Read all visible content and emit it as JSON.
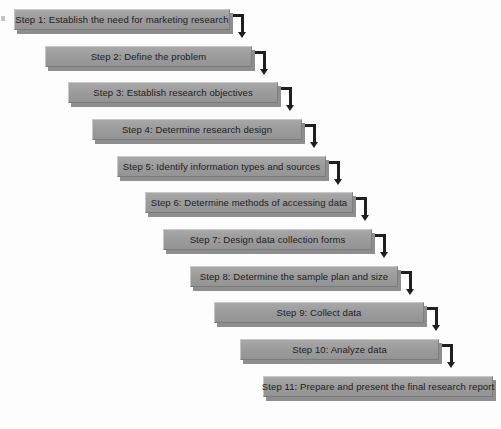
{
  "diagram": {
    "type": "cascading-staircase-flowchart",
    "colors": {
      "box_fill": "#9c9c9c",
      "box_highlight": "#c9c9c9",
      "box_shadow": "#8e8e8e",
      "text": "#1d1d1d",
      "connector": "#1f1f1f",
      "background": "#fdfdfd"
    },
    "layout": {
      "canvas_width": 501,
      "canvas_height": 429,
      "box_height": 21,
      "x_step": 23,
      "y_step": 36.6,
      "shadow_offset_x": 3,
      "shadow_offset_y": 4
    },
    "steps": [
      {
        "number": 1,
        "label": "Step 1: Establish the need for marketing research",
        "x": 14,
        "y": 9,
        "width": 216
      },
      {
        "number": 2,
        "label": "Step 2: Define the problem",
        "x": 45,
        "y": 46,
        "width": 207
      },
      {
        "number": 3,
        "label": "Step 3: Establish research objectives",
        "x": 68,
        "y": 82,
        "width": 210
      },
      {
        "number": 4,
        "label": "Step 4: Determine research design",
        "x": 92,
        "y": 119,
        "width": 210
      },
      {
        "number": 5,
        "label": "Step 5: Identify information types and sources",
        "x": 117,
        "y": 156,
        "width": 209
      },
      {
        "number": 6,
        "label": "Step 6: Determine methods of accessing data",
        "x": 145,
        "y": 192,
        "width": 208
      },
      {
        "number": 7,
        "label": "Step 7: Design data collection forms",
        "x": 163,
        "y": 229,
        "width": 209
      },
      {
        "number": 8,
        "label": "Step 8: Determine the sample plan and size",
        "x": 190,
        "y": 266,
        "width": 208
      },
      {
        "number": 9,
        "label": "Step 9: Collect data",
        "x": 214,
        "y": 302,
        "width": 210
      },
      {
        "number": 10,
        "label": "Step 10: Analyze data",
        "x": 240,
        "y": 339,
        "width": 199
      },
      {
        "number": 11,
        "label": "Step 11: Prepare and present the final research report",
        "x": 263,
        "y": 376,
        "width": 230
      }
    ],
    "connectors": [
      {
        "from": 1,
        "to": 2,
        "x": 231,
        "y": 14,
        "h_len": 13,
        "v_len": 18
      },
      {
        "from": 2,
        "to": 3,
        "x": 253,
        "y": 51,
        "h_len": 13,
        "v_len": 18
      },
      {
        "from": 3,
        "to": 4,
        "x": 279,
        "y": 87,
        "h_len": 13,
        "v_len": 18
      },
      {
        "from": 4,
        "to": 5,
        "x": 303,
        "y": 124,
        "h_len": 13,
        "v_len": 18
      },
      {
        "from": 5,
        "to": 6,
        "x": 327,
        "y": 161,
        "h_len": 13,
        "v_len": 18
      },
      {
        "from": 6,
        "to": 7,
        "x": 354,
        "y": 197,
        "h_len": 13,
        "v_len": 18
      },
      {
        "from": 7,
        "to": 8,
        "x": 373,
        "y": 234,
        "h_len": 13,
        "v_len": 18
      },
      {
        "from": 8,
        "to": 9,
        "x": 399,
        "y": 271,
        "h_len": 13,
        "v_len": 18
      },
      {
        "from": 9,
        "to": 10,
        "x": 425,
        "y": 307,
        "h_len": 13,
        "v_len": 18
      },
      {
        "from": 10,
        "to": 11,
        "x": 440,
        "y": 344,
        "h_len": 13,
        "v_len": 18
      }
    ]
  }
}
